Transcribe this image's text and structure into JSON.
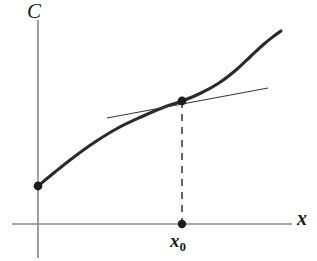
{
  "figure": {
    "type": "math-diagram",
    "background_color": "#ffffff",
    "ink_color": "#262626",
    "axis_color": "#7a7a7a"
  },
  "labels": {
    "y_axis": "C",
    "x_axis": "x",
    "tangent_abscissa_base": "x",
    "tangent_abscissa_subscript": "0"
  },
  "chart_data": {
    "type": "line",
    "title": "",
    "xlabel": "x",
    "ylabel": "C",
    "grid": false,
    "legend": null,
    "xlim": [
      12,
      292
    ],
    "ylim": [
      224,
      20
    ],
    "axes": {
      "origin": [
        38,
        224
      ],
      "x_axis_start": [
        12,
        224
      ],
      "x_axis_end": [
        292,
        224
      ],
      "y_axis_top": [
        38,
        20
      ],
      "y_axis_bottom": [
        38,
        258
      ]
    },
    "series": [
      {
        "name": "cost-curve",
        "style": "solid-thick",
        "points": [
          [
            38,
            186
          ],
          [
            55,
            172
          ],
          [
            74,
            157
          ],
          [
            95,
            142
          ],
          [
            118,
            128
          ],
          [
            141,
            117
          ],
          [
            162,
            108
          ],
          [
            182,
            101
          ],
          [
            201,
            93
          ],
          [
            219,
            83
          ],
          [
            236,
            70
          ],
          [
            251,
            56
          ],
          [
            264,
            44
          ],
          [
            274,
            36
          ],
          [
            281,
            31
          ]
        ]
      },
      {
        "name": "tangent-line",
        "style": "solid-thin",
        "points": [
          [
            107,
            118
          ],
          [
            268,
            88
          ]
        ]
      },
      {
        "name": "drop-line",
        "style": "dashed",
        "points": [
          [
            182,
            101
          ],
          [
            182,
            224
          ]
        ]
      }
    ],
    "markers": [
      {
        "name": "curve-start-point",
        "x": 38,
        "y": 186
      },
      {
        "name": "tangent-point",
        "x": 182,
        "y": 101
      },
      {
        "name": "x0-axis-point",
        "x": 182,
        "y": 224
      }
    ],
    "annotations": [
      {
        "name": "y-axis-label",
        "text": "C",
        "x": 34,
        "y": 10
      },
      {
        "name": "x-axis-label",
        "text": "x",
        "x": 303,
        "y": 218
      },
      {
        "name": "x0-label",
        "text": "x0",
        "x": 182,
        "y": 243
      }
    ]
  }
}
